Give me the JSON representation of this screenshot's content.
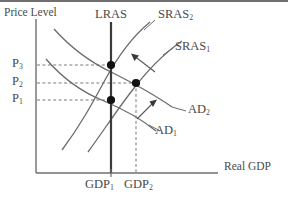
{
  "figure": {
    "type": "economics-diagram",
    "axes": {
      "y_label": "Price Level",
      "x_label": "Real GDP",
      "y_ticks": [
        "P3",
        "P2",
        "P1"
      ],
      "x_ticks": [
        "GDP1",
        "GDP2"
      ]
    },
    "curves": [
      {
        "id": "lras",
        "label": "LRAS",
        "sub": "",
        "kind": "vertical"
      },
      {
        "id": "sras2",
        "label": "SRAS",
        "sub": "2",
        "kind": "upward"
      },
      {
        "id": "sras1",
        "label": "SRAS",
        "sub": "1",
        "kind": "upward"
      },
      {
        "id": "ad2",
        "label": "AD",
        "sub": "2",
        "kind": "downward"
      },
      {
        "id": "ad1",
        "label": "AD",
        "sub": "1",
        "kind": "downward"
      }
    ],
    "tick_labels": {
      "p3": {
        "base": "P",
        "sub": "3"
      },
      "p2": {
        "base": "P",
        "sub": "2"
      },
      "p1": {
        "base": "P",
        "sub": "1"
      },
      "gdp1": {
        "base": "GDP",
        "sub": "1"
      },
      "gdp2": {
        "base": "GDP",
        "sub": "2"
      }
    },
    "equilibria": [
      {
        "id": "point-p3",
        "price": "P3",
        "output": "GDP1",
        "x": 111,
        "y": 65
      },
      {
        "id": "point-p2",
        "price": "P2",
        "output": "GDP2",
        "x": 136,
        "y": 83
      },
      {
        "id": "point-p1",
        "price": "P1",
        "output": "GDP1",
        "x": 111,
        "y": 100
      }
    ],
    "arrows": [
      {
        "id": "sras-shift-arrow",
        "meaning": "SRAS1 shifts left to SRAS2"
      },
      {
        "id": "ad-shift-arrow",
        "meaning": "AD1 shifts right to AD2"
      }
    ],
    "colors": {
      "ink": "#4a4a4a",
      "curve": "#6b6b6b",
      "axis": "#6f6f6f",
      "lras": "#3a3a3a",
      "dot": "#111111",
      "background": "#ffffff"
    }
  }
}
